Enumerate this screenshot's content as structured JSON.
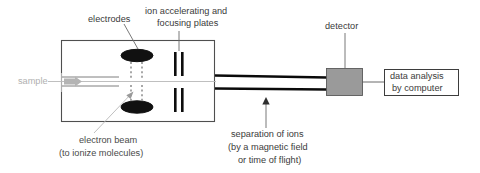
{
  "diagram": {
    "background_color": "#ffffff"
  },
  "labels": {
    "electrodes": "electrodes",
    "ion_plates_line1": "ion accelerating and",
    "ion_plates_line2": "focusing plates",
    "detector": "detector",
    "sample": "sample",
    "electron_beam_line1": "electron beam",
    "electron_beam_line2": "(to ionize molecules)",
    "separation_line1": "separation of ions",
    "separation_line2": "(by a magnetic field",
    "separation_line3": "or time of flight)",
    "data_analysis_line1": "data analysis",
    "data_analysis_line2": "by computer"
  },
  "colors": {
    "label_text": "#4a4a4a",
    "faint_text": "#b0b0b0",
    "chamber_stroke": "#4f4f4f",
    "electrode_fill": "#111111",
    "plate_fill": "#0d0d0d",
    "beam_stroke": "#0a0a0a",
    "detector_fill": "#9a9a9a",
    "box_stroke": "#3d3d3d"
  }
}
